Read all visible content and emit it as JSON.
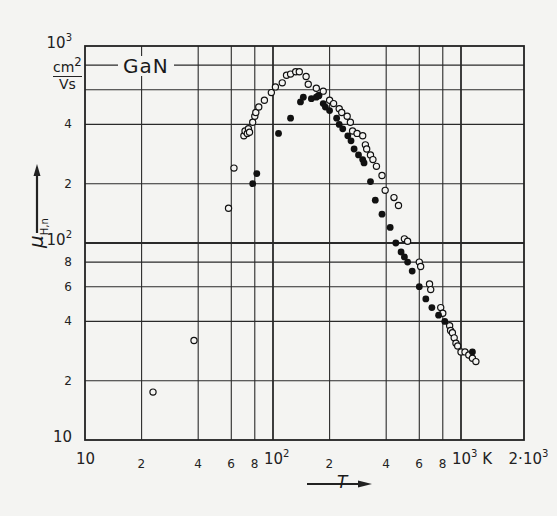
{
  "chart_data": {
    "type": "scatter",
    "title": "GaN",
    "xlabel": "T",
    "x_unit": "K",
    "ylabel": "μ_H,n",
    "y_unit": "cm2/Vs",
    "xscale": "log",
    "yscale": "log",
    "xlim": [
      10,
      2000
    ],
    "ylim": [
      10,
      1000
    ],
    "grid": true,
    "x_tick_labels": [
      "10",
      "2",
      "4",
      "6",
      "8",
      "10^2",
      "2",
      "4",
      "6",
      "8",
      "10^3 K",
      "2·10^3"
    ],
    "x_tick_values": [
      10,
      20,
      40,
      60,
      80,
      100,
      200,
      400,
      600,
      800,
      1000,
      2000
    ],
    "y_tick_labels": [
      "10",
      "2",
      "4",
      "6",
      "8",
      "10^2",
      "2",
      "4",
      "10^3"
    ],
    "y_tick_values": [
      10,
      20,
      40,
      60,
      80,
      100,
      200,
      400,
      1000
    ],
    "series": [
      {
        "name": "open circles",
        "marker": "open-circle",
        "points": [
          [
            23,
            17.5
          ],
          [
            38,
            32
          ],
          [
            58,
            150
          ],
          [
            62,
            240
          ],
          [
            70,
            350
          ],
          [
            71,
            370
          ],
          [
            73,
            360
          ],
          [
            74,
            380
          ],
          [
            75,
            365
          ],
          [
            78,
            410
          ],
          [
            80,
            440
          ],
          [
            81,
            460
          ],
          [
            84,
            490
          ],
          [
            90,
            530
          ],
          [
            98,
            580
          ],
          [
            103,
            620
          ],
          [
            112,
            650
          ],
          [
            118,
            710
          ],
          [
            124,
            720
          ],
          [
            132,
            740
          ],
          [
            138,
            740
          ],
          [
            150,
            700
          ],
          [
            154,
            640
          ],
          [
            170,
            610
          ],
          [
            175,
            560
          ],
          [
            185,
            590
          ],
          [
            200,
            530
          ],
          [
            210,
            510
          ],
          [
            225,
            480
          ],
          [
            232,
            460
          ],
          [
            248,
            440
          ],
          [
            258,
            410
          ],
          [
            265,
            370
          ],
          [
            280,
            360
          ],
          [
            300,
            350
          ],
          [
            310,
            315
          ],
          [
            315,
            300
          ],
          [
            330,
            280
          ],
          [
            340,
            265
          ],
          [
            355,
            245
          ],
          [
            380,
            220
          ],
          [
            395,
            185
          ],
          [
            440,
            170
          ],
          [
            465,
            155
          ],
          [
            500,
            105
          ],
          [
            520,
            102
          ],
          [
            600,
            80
          ],
          [
            610,
            76
          ],
          [
            680,
            62
          ],
          [
            690,
            58
          ],
          [
            780,
            47
          ],
          [
            800,
            44
          ],
          [
            870,
            38
          ],
          [
            880,
            36
          ],
          [
            900,
            35
          ],
          [
            920,
            33
          ],
          [
            940,
            31
          ],
          [
            960,
            30
          ],
          [
            1000,
            28
          ],
          [
            1050,
            28
          ],
          [
            1100,
            27
          ],
          [
            1150,
            26
          ],
          [
            1200,
            25
          ]
        ]
      },
      {
        "name": "filled circles",
        "marker": "filled-circle",
        "points": [
          [
            78,
            200
          ],
          [
            82,
            225
          ],
          [
            107,
            360
          ],
          [
            124,
            430
          ],
          [
            140,
            520
          ],
          [
            145,
            550
          ],
          [
            160,
            540
          ],
          [
            170,
            550
          ],
          [
            175,
            560
          ],
          [
            185,
            510
          ],
          [
            190,
            490
          ],
          [
            200,
            470
          ],
          [
            218,
            430
          ],
          [
            225,
            400
          ],
          [
            235,
            380
          ],
          [
            250,
            350
          ],
          [
            260,
            330
          ],
          [
            270,
            300
          ],
          [
            285,
            280
          ],
          [
            300,
            265
          ],
          [
            305,
            255
          ],
          [
            330,
            205
          ],
          [
            350,
            165
          ],
          [
            380,
            140
          ],
          [
            420,
            120
          ],
          [
            450,
            100
          ],
          [
            480,
            90
          ],
          [
            500,
            85
          ],
          [
            520,
            80
          ],
          [
            550,
            72
          ],
          [
            600,
            60
          ],
          [
            650,
            52
          ],
          [
            700,
            47
          ],
          [
            760,
            43
          ],
          [
            820,
            40
          ],
          [
            1150,
            28
          ]
        ]
      }
    ]
  },
  "labels": {
    "title": "GaN",
    "y_unit_numerator": "cm",
    "y_unit_numerator_exp": "2",
    "y_unit_denominator": "Vs",
    "y_axis_symbol": "μ",
    "y_axis_subscript": "H,n",
    "x_axis_symbol": "T"
  }
}
